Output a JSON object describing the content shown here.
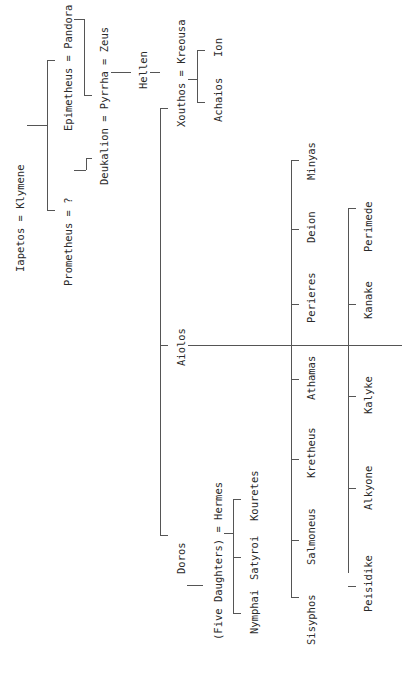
{
  "diagram": {
    "type": "family-tree",
    "orientation": "rotated-90-ccw",
    "nodes": {
      "iapetos": "Iapetos = Klymene",
      "prometheus": "Prometheus = ?",
      "epimetheus": "Epimetheus = Pandora",
      "deukalion": "Deukalion = Pyrrha = Zeus",
      "hellen": "Hellen",
      "xouthos": "Xouthos = Kreousa",
      "achaios": "Achaios",
      "ion": "Ion",
      "aiolos": "Aiolos",
      "doros": "Doros",
      "five_daughters": "(Five Daughters) = Hermes",
      "nymphai": "Nymphai",
      "satyroi": "Satyroi",
      "kouretes": "Kouretes",
      "sons": [
        "Sisyphos",
        "Salmoneus",
        "Kretheus",
        "Athamas",
        "Perieres",
        "Deion",
        "Minyas"
      ],
      "daughters": [
        "Peisidike",
        "Alkyone",
        "Kalyke",
        "Kanake",
        "Perimede"
      ]
    },
    "line_color": "#555555",
    "text_color": "#2a2a2a"
  }
}
